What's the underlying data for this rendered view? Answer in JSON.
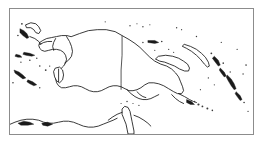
{
  "figure": {
    "kind": "reference-map",
    "title": "New Guinea region outline map",
    "frame_color": "#8c8c8c",
    "background_color": "#ffffff",
    "coastline_color": "#141414",
    "border_line_color": "#2a2a2a",
    "width_px": 265,
    "height_px": 144
  },
  "map": {
    "projection_hint": "equirectangular",
    "extent": {
      "west_longitude": "125E",
      "east_longitude": "162E",
      "north_latitude": "2N",
      "south_latitude": "13S"
    },
    "features": {
      "mainland": "New Guinea",
      "political_border": "Indonesia - Papua New Guinea border at 141E",
      "regions": [
        "Bird's Head Peninsula",
        "Papua (Indonesia)",
        "Papua New Guinea",
        "Gulf of Papua",
        "Milne Bay"
      ],
      "island_groups": [
        "Bismarck Archipelago",
        "New Britain",
        "New Ireland",
        "Admiralty Islands",
        "Bougainville",
        "Solomon Islands",
        "Louisiade Archipelago",
        "D'Entrecasteaux Islands",
        "Aru Islands",
        "Maluku Islands",
        "Halmahera",
        "Seram",
        "Buru"
      ],
      "seas": [
        "Arafura Sea",
        "Banda Sea",
        "Coral Sea",
        "Bismarck Sea",
        "Solomon Sea",
        "Gulf of Carpentaria"
      ],
      "adjacent_landmass": "Northern Australia"
    }
  }
}
